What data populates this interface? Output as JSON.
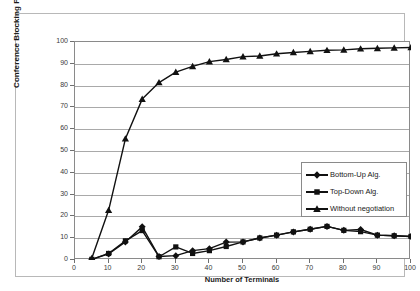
{
  "chart_data": {
    "type": "line",
    "title": "",
    "xlabel": "Number of Terminals",
    "ylabel": "Conference Blocking Probability [%]",
    "xlim": [
      0,
      100
    ],
    "ylim": [
      0,
      100
    ],
    "xticks": [
      0,
      10,
      20,
      30,
      40,
      50,
      60,
      70,
      80,
      90,
      100
    ],
    "yticks": [
      0,
      10,
      20,
      30,
      40,
      50,
      60,
      70,
      80,
      90,
      100
    ],
    "grid": "horizontal",
    "legend_position": "center-right",
    "x": [
      5,
      10,
      15,
      20,
      25,
      30,
      35,
      40,
      45,
      50,
      55,
      60,
      65,
      70,
      75,
      80,
      85,
      90,
      95,
      100
    ],
    "series": [
      {
        "name": "Bottom-Up Alg.",
        "marker": "diamond",
        "color": "#111111",
        "values": [
          0.3,
          2.8,
          8.3,
          15.2,
          1.6,
          2.0,
          4.3,
          5.2,
          8.2,
          8.3,
          10.1,
          11.4,
          12.9,
          14.1,
          15.4,
          13.6,
          14.0,
          11.4,
          11.1,
          10.8
        ]
      },
      {
        "name": "Top-Down Alg.",
        "marker": "square",
        "color": "#111111",
        "values": [
          0.3,
          3.0,
          8.8,
          13.5,
          1.5,
          6.0,
          3.0,
          4.3,
          6.2,
          8.3,
          10.1,
          11.4,
          12.9,
          14.1,
          15.4,
          13.6,
          13.0,
          11.4,
          11.1,
          10.8
        ]
      },
      {
        "name": "Without negotiation",
        "marker": "triangle",
        "color": "#111111",
        "values": [
          0.8,
          22.8,
          55.6,
          73.8,
          81.4,
          86.2,
          88.8,
          91.0,
          92.0,
          93.3,
          93.6,
          94.6,
          95.2,
          95.7,
          96.2,
          96.4,
          96.9,
          97.1,
          97.3,
          97.5
        ]
      }
    ]
  },
  "legend": {
    "items": [
      {
        "label": "Bottom-Up Alg.",
        "marker": "diamond"
      },
      {
        "label": "Top-Down Alg.",
        "marker": "square"
      },
      {
        "label": "Without negotiation",
        "marker": "triangle"
      }
    ]
  },
  "axis_labels": {
    "y": "Conference Blocking Probability [%]",
    "x": "Number of Terminals"
  }
}
